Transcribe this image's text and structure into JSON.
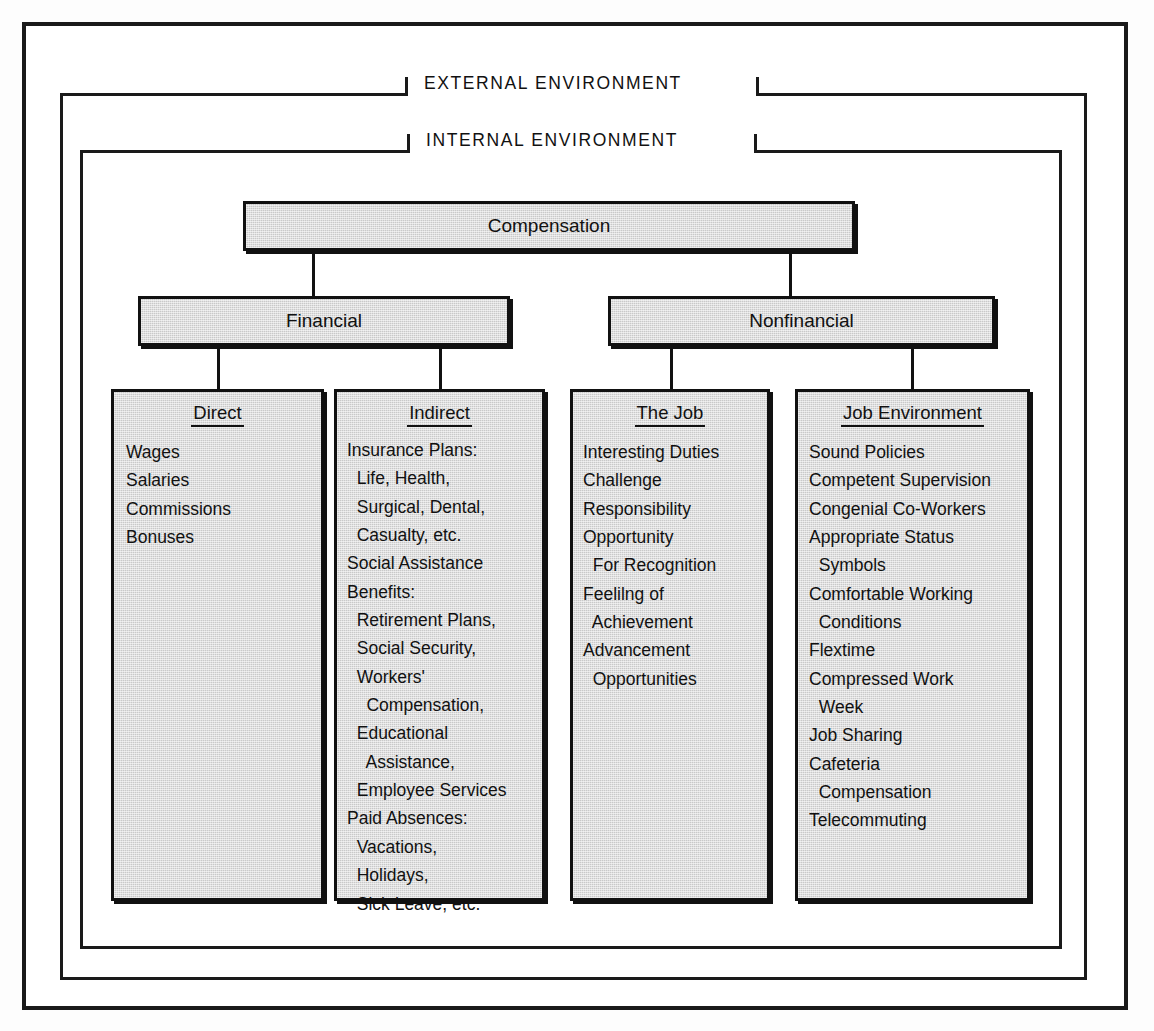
{
  "diagram": {
    "external_environment_label": "EXTERNAL ENVIRONMENT",
    "internal_environment_label": "INTERNAL ENVIRONMENT",
    "root": {
      "label": "Compensation"
    },
    "branches": [
      {
        "label": "Financial"
      },
      {
        "label": "Nonfinancial"
      }
    ],
    "columns": [
      {
        "title": "Direct",
        "items": [
          "Wages",
          "Salaries",
          "Commissions",
          "Bonuses"
        ]
      },
      {
        "title": "Indirect",
        "items": [
          "Insurance Plans:",
          "  Life, Health,",
          "  Surgical, Dental,",
          "  Casualty, etc.",
          "Social Assistance",
          "Benefits:",
          "  Retirement Plans,",
          "  Social Security,",
          "  Workers'",
          "    Compensation,",
          "  Educational",
          "    Assistance,",
          "  Employee Services",
          "Paid Absences:",
          "  Vacations,",
          "  Holidays,",
          "  Sick Leave, etc."
        ]
      },
      {
        "title": "The Job",
        "items": [
          "Interesting Duties",
          "Challenge",
          "Responsibility",
          "Opportunity",
          "  For Recognition",
          "Feelilng of",
          "  Achievement",
          "Advancement",
          "  Opportunities"
        ]
      },
      {
        "title": "Job Environment",
        "items": [
          "Sound Policies",
          "Competent Supervision",
          "Congenial Co-Workers",
          "Appropriate Status",
          "  Symbols",
          "Comfortable Working",
          "  Conditions",
          "Flextime",
          "Compressed Work",
          "  Week",
          "Job Sharing",
          "Cafeteria",
          "  Compensation",
          "Telecommuting"
        ]
      }
    ],
    "colors": {
      "box_fill": "#c9c9c9",
      "line": "#111111",
      "page_background": "#ffffff"
    }
  }
}
